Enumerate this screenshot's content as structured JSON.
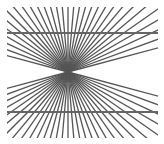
{
  "figure": {
    "width": 164,
    "height": 144,
    "background": "#ffffff",
    "center": {
      "x": 68,
      "y": 72
    },
    "clip": {
      "x": 7,
      "y": 7,
      "width": 151,
      "height": 131
    },
    "ray_color": "#555555",
    "ray_width": 1.3,
    "ray_count": 72,
    "horizontal_lines": [
      {
        "y": 33,
        "x1": 7,
        "x2": 158,
        "color": "#666666",
        "width": 1.8
      },
      {
        "y": 112,
        "x1": 7,
        "x2": 158,
        "color": "#666666",
        "width": 1.8
      }
    ]
  }
}
